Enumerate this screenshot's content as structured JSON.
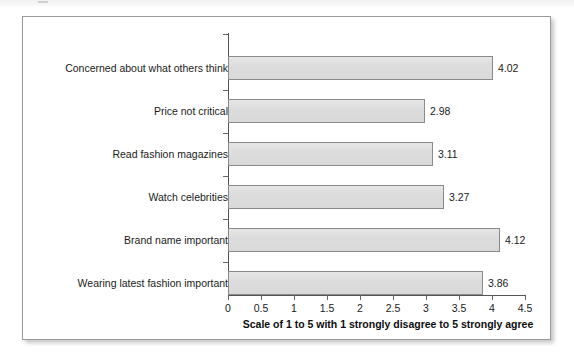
{
  "chart_data": {
    "type": "bar",
    "orientation": "horizontal",
    "title": "",
    "xlabel": "Scale of 1 to 5 with 1 strongly disagree to 5 strongly agree",
    "ylabel": "",
    "xlim": [
      0,
      4.5
    ],
    "xticks": [
      "0",
      "0.5",
      "1",
      "1.5",
      "2",
      "2.5",
      "3",
      "3.5",
      "4",
      "4.5"
    ],
    "xtick_values": [
      0,
      0.5,
      1,
      1.5,
      2,
      2.5,
      3,
      3.5,
      4,
      4.5
    ],
    "grid": false,
    "legend": false,
    "categories": [
      "Concerned about what others think",
      "Price not critical",
      "Read fashion magazines",
      "Watch celebrities",
      "Brand name important",
      "Wearing latest fashion important"
    ],
    "values": [
      4.02,
      2.98,
      3.11,
      3.27,
      4.12,
      3.86
    ],
    "value_labels": [
      "4.02",
      "2.98",
      "3.11",
      "3.27",
      "4.12",
      "3.86"
    ],
    "bar_fill_color": "#dedede",
    "bar_border_color": "#8a8a8a",
    "axis_color": "#555555",
    "text_color": "#1b1b1b"
  }
}
